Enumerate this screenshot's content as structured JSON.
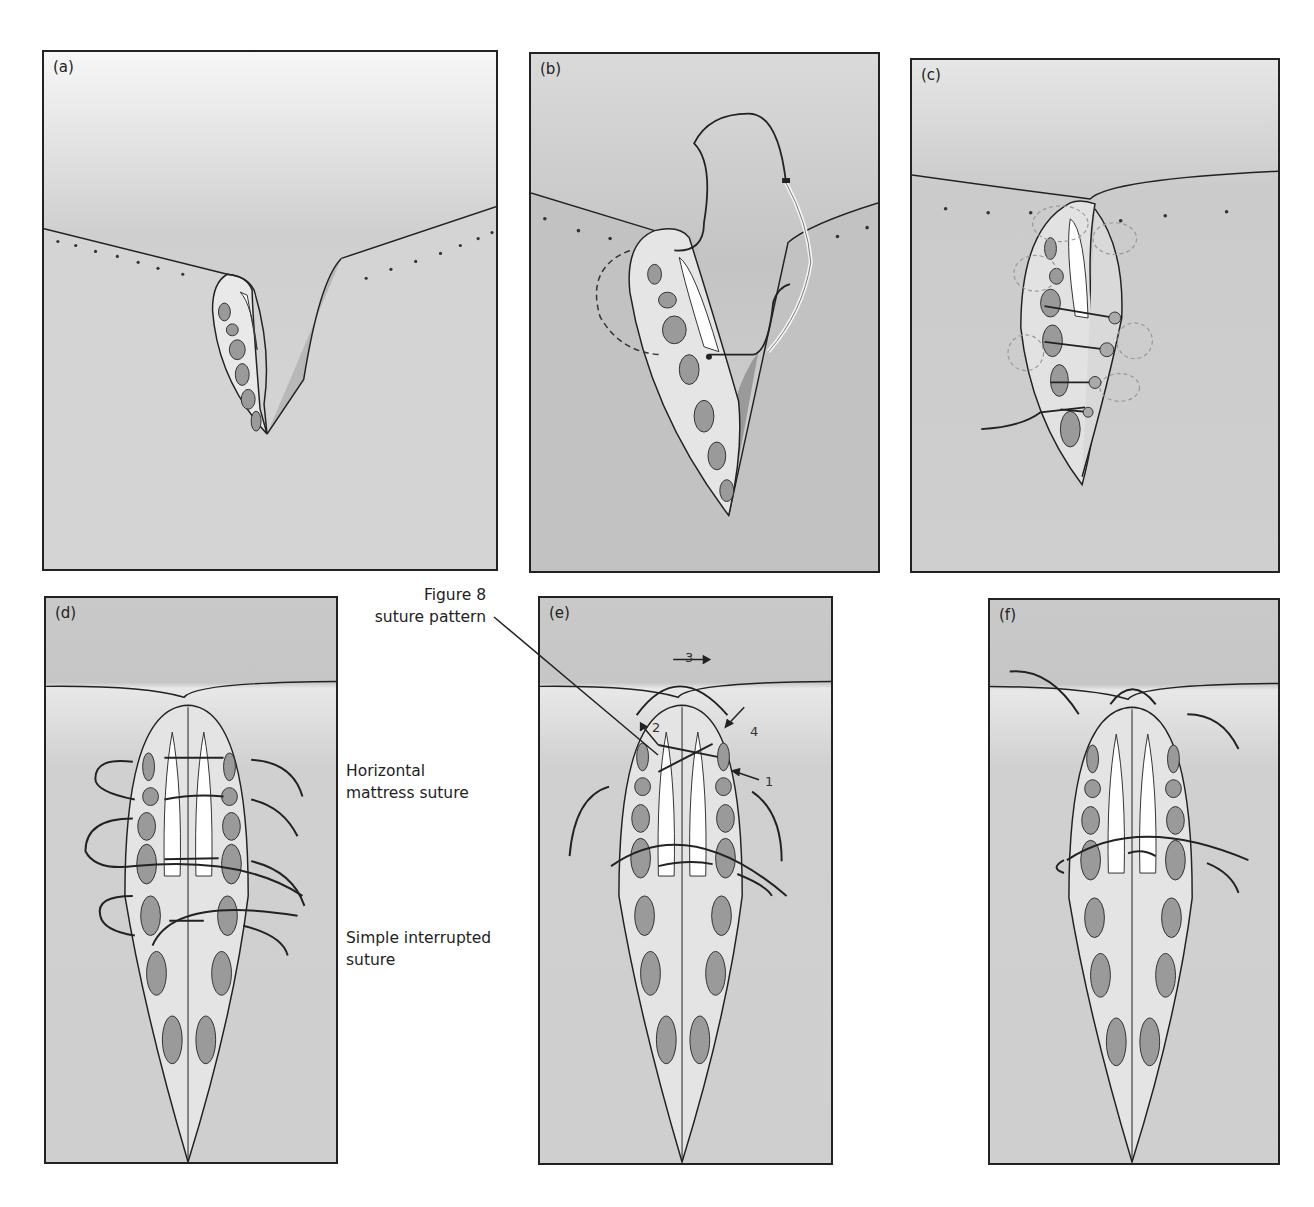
{
  "figure": {
    "panels": [
      {
        "id": "a",
        "label": "(a)",
        "description": "Wedge laceration through muscle layers, flap open"
      },
      {
        "id": "b",
        "label": "(b)",
        "description": "Needle and suture passed through flap edge"
      },
      {
        "id": "c",
        "label": "(c)",
        "description": "Sutures placed and partially tightened"
      },
      {
        "id": "d",
        "label": "(d)",
        "description": "Horizontal mattress and simple interrupted sutures"
      },
      {
        "id": "e",
        "label": "(e)",
        "description": "Figure 8 suture pattern with numbered steps"
      },
      {
        "id": "f",
        "label": "(f)",
        "description": "Completed closure"
      }
    ],
    "annotations": {
      "figure8_line1": "Figure 8",
      "figure8_line2": "suture pattern",
      "horizontal_line1": "Horizontal",
      "horizontal_line2": "mattress suture",
      "simple_line1": "Simple interrupted",
      "simple_line2": "suture"
    },
    "step_numbers": {
      "step1": "1",
      "step2": "2",
      "step3": "3",
      "step4": "4"
    },
    "colors": {
      "background": "#ffffff",
      "skin": "#c9c9c9",
      "skin_light": "#e6e6e6",
      "outline": "#222222",
      "muscle": "#9a9a9a"
    }
  }
}
